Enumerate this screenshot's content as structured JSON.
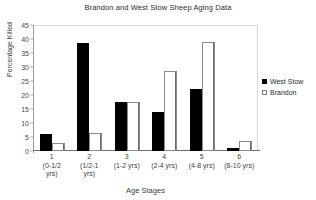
{
  "chart_data": {
    "type": "bar",
    "title": "Brandon and West Stow Sheep Aging Data",
    "xlabel": "Age Stages",
    "ylabel": "Percentage Killed",
    "ylim": [
      0,
      45
    ],
    "ytick_step": 5,
    "yticks": [
      0,
      5,
      10,
      15,
      20,
      25,
      30,
      35,
      40,
      45
    ],
    "grid": false,
    "legend_position": "right",
    "categories": [
      "1\n(0-1/2 yrs)",
      "2\n(1/2-1 yrs)",
      "3\n(1-2 yrs)",
      "4\n(2-4 yrs)",
      "5\n(4-8 yrs)",
      "6\n(8-10 yrs)"
    ],
    "category_parts": [
      {
        "index": "1",
        "range": "(0-1/2",
        "range2": "yrs)"
      },
      {
        "index": "2",
        "range": "(1/2-1",
        "range2": "yrs)"
      },
      {
        "index": "3",
        "range": "(1-2 yrs)",
        "range2": ""
      },
      {
        "index": "4",
        "range": "(2-4 yrs)",
        "range2": ""
      },
      {
        "index": "5",
        "range": "(4-8 yrs)",
        "range2": ""
      },
      {
        "index": "6",
        "range": "(8-10 yrs)",
        "range2": ""
      }
    ],
    "series": [
      {
        "name": "West Stow",
        "color": "#000000",
        "values": [
          6,
          38.5,
          17.5,
          14,
          22,
          1
        ]
      },
      {
        "name": "Brandon",
        "color": "#ffffff",
        "values": [
          3,
          6.5,
          17.5,
          28.5,
          39,
          3.5
        ]
      }
    ]
  },
  "legend": {
    "items": [
      {
        "label": "West Stow",
        "style": "filled"
      },
      {
        "label": "Brandon",
        "style": "outlined"
      }
    ]
  }
}
